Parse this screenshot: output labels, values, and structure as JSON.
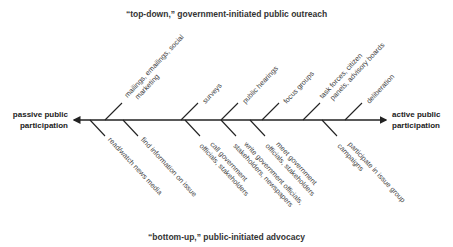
{
  "titles": {
    "top": "“top-down,” government-initiated public outreach",
    "bottom": "“bottom-up,” public-initiated advocacy"
  },
  "axis": {
    "left_label": [
      "passive public",
      "participation"
    ],
    "right_label": [
      "active public",
      "participation"
    ]
  },
  "upper_branches": [
    {
      "lines": [
        "mailings, emailings, social",
        "marketing"
      ]
    },
    {
      "lines": [
        "surveys"
      ]
    },
    {
      "lines": [
        "public hearings"
      ]
    },
    {
      "lines": [
        "focus groups"
      ]
    },
    {
      "lines": [
        "task forces, citizen",
        "panels, advisory boards"
      ]
    },
    {
      "lines": [
        "deliberation"
      ]
    }
  ],
  "lower_branches": [
    {
      "lines": [
        "read/watch news media"
      ]
    },
    {
      "lines": [
        "find information on issue"
      ]
    },
    {
      "lines": [
        "call government",
        "officials, stakeholders"
      ]
    },
    {
      "lines": [
        "write government officials,",
        "stakeholders, newspapers"
      ]
    },
    {
      "lines": [
        "meet government",
        "officials, stakeholders"
      ]
    },
    {
      "lines": [
        "participate in issue group",
        "campaigns"
      ]
    }
  ],
  "colors": {
    "line": "#222222",
    "text": "#444444"
  }
}
